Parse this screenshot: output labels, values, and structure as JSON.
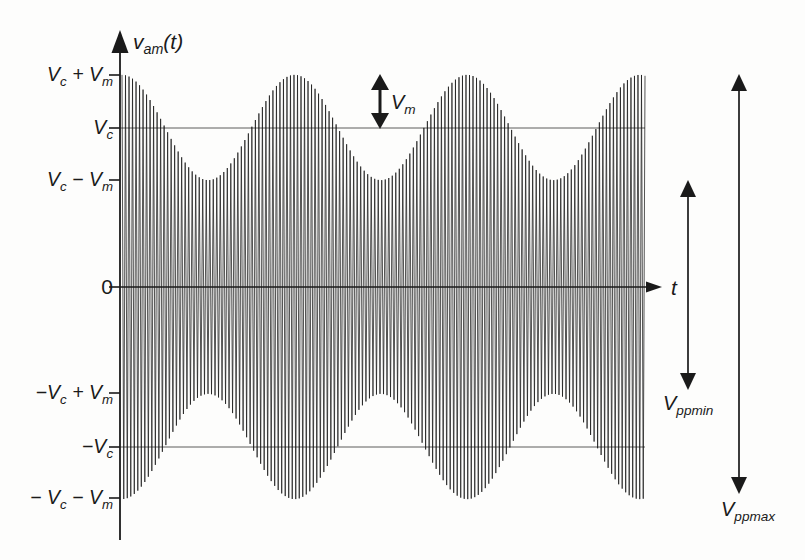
{
  "axes": {
    "y_label": "v_am(t)",
    "x_label": "t",
    "origin_label": "0"
  },
  "y_ticks": [
    "V_c + V_m",
    "V_c",
    "V_c − V_m",
    "0",
    "−V_c + V_m",
    "−V_c",
    "− V_c − V_m"
  ],
  "annotations": [
    {
      "label": "V_m",
      "spans_from": "V_c",
      "spans_to": "V_c + V_m"
    },
    {
      "label": "V_ppmin",
      "spans_from": "V_c − V_m",
      "spans_to": "−V_c + V_m"
    },
    {
      "label": "V_ppmax",
      "spans_from": "V_c + V_m",
      "spans_to": "−V_c − V_m"
    }
  ],
  "colors": {
    "ink": "#1a1a1a",
    "trace": "#161616",
    "reference_line": "#4a4a4a",
    "background": "#fdfdfc"
  },
  "chart_data": {
    "type": "line",
    "xlabel": "t",
    "ylabel": "v_am(t)",
    "series": [
      {
        "name": "v_am(t)",
        "definition": "envelope (V_c + V_m·cos(2π·fm·t)) filled with carrier oscillation between +envelope and −envelope"
      }
    ],
    "y_levels_in_Vc_units": [
      1.33,
      1.0,
      0.67,
      0.0,
      -0.67,
      -1.0,
      -1.33
    ],
    "y_level_labels": [
      "V_c + V_m",
      "V_c",
      "V_c − V_m",
      "0",
      "−V_c + V_m",
      "−V_c",
      "−V_c − V_m"
    ],
    "modulation_index": 0.33,
    "modulation_cycles_shown": 3.03,
    "carrier_cycles_shown": 149,
    "envelope_phase": "maximum at left edge; peaks at t/Tm = 0, 1, 2, 3; troughs at 0.5, 1.5, 2.5",
    "grid": "off",
    "reference_lines": [
      "V_c",
      "−V_c"
    ],
    "peak_to_peak_annotations": {
      "V_ppmin": "2(V_c − V_m)",
      "V_ppmax": "2(V_c + V_m)"
    }
  }
}
